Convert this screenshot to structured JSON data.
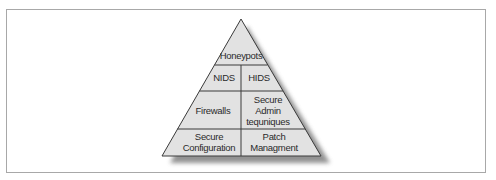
{
  "diagram": {
    "type": "pyramid",
    "title": "",
    "colors": {
      "fill": "#e2e2e2",
      "stroke": "#3a3a3a",
      "shadow": "#6e6e6e",
      "frame_border": "#a8a8a8",
      "text": "#2a2a2a"
    },
    "tiers": [
      {
        "level": 1,
        "cells": [
          {
            "label_lines": [
              "Honeypots"
            ]
          }
        ]
      },
      {
        "level": 2,
        "cells": [
          {
            "label_lines": [
              "NIDS"
            ]
          },
          {
            "label_lines": [
              "HIDS"
            ]
          }
        ]
      },
      {
        "level": 3,
        "cells": [
          {
            "label_lines": [
              "Firewalls"
            ]
          },
          {
            "label_lines": [
              "Secure",
              "Admin",
              "tequniques"
            ]
          }
        ]
      },
      {
        "level": 4,
        "cells": [
          {
            "label_lines": [
              "Secure",
              "Configuration"
            ]
          },
          {
            "label_lines": [
              "Patch",
              "Managment"
            ]
          }
        ]
      }
    ]
  }
}
